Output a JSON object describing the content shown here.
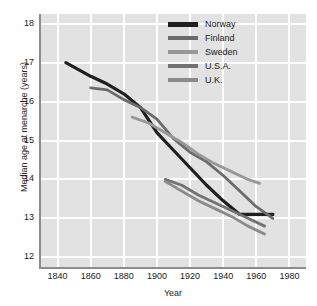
{
  "chart_data": {
    "type": "line",
    "title": "",
    "xlabel": "Year",
    "ylabel": "Median age at menarche (years)",
    "xlim": [
      1830,
      1990
    ],
    "ylim": [
      11.75,
      18.25
    ],
    "xticks": [
      1840,
      1860,
      1880,
      1900,
      1920,
      1940,
      1960,
      1980
    ],
    "yticks": [
      12,
      13,
      14,
      15,
      16,
      17,
      18
    ],
    "grid": true,
    "legend_position": "top-right",
    "background_color": "#e2e2e2",
    "gridline_color": "#ffffff",
    "axis_color": "#8c8c8c",
    "series": [
      {
        "name": "Norway",
        "color": "#1f1f1f",
        "x": [
          1845,
          1860,
          1870,
          1880,
          1890,
          1900,
          1910,
          1920,
          1930,
          1940,
          1950,
          1960,
          1970
        ],
        "values": [
          17.0,
          16.65,
          16.45,
          16.2,
          15.85,
          15.2,
          14.75,
          14.3,
          13.85,
          13.45,
          13.1,
          13.1,
          13.1
        ]
      },
      {
        "name": "Finland",
        "color": "#6b6b6b",
        "x": [
          1860,
          1870,
          1880,
          1890,
          1900,
          1910,
          1920,
          1930,
          1940,
          1950,
          1960,
          1970
        ],
        "values": [
          16.35,
          16.3,
          16.05,
          15.85,
          15.55,
          15.05,
          14.7,
          14.45,
          14.1,
          13.7,
          13.3,
          13.0
        ]
      },
      {
        "name": "Sweden",
        "color": "#989898",
        "x": [
          1885,
          1895,
          1905,
          1915,
          1925,
          1935,
          1945,
          1955,
          1962
        ],
        "values": [
          15.6,
          15.45,
          15.2,
          14.95,
          14.65,
          14.4,
          14.2,
          14.0,
          13.9
        ]
      },
      {
        "name": "U.S.A.",
        "color": "#727272",
        "x": [
          1905,
          1915,
          1925,
          1935,
          1945,
          1955,
          1965
        ],
        "values": [
          14.0,
          13.85,
          13.6,
          13.4,
          13.2,
          13.0,
          12.8
        ]
      },
      {
        "name": "U.K.",
        "color": "#8a8a8a",
        "x": [
          1905,
          1915,
          1925,
          1935,
          1945,
          1955,
          1965
        ],
        "values": [
          13.95,
          13.7,
          13.45,
          13.25,
          13.05,
          12.8,
          12.6
        ]
      }
    ]
  },
  "legend": {
    "items": [
      {
        "label": "Norway"
      },
      {
        "label": "Finland"
      },
      {
        "label": "Sweden"
      },
      {
        "label": "U.S.A."
      },
      {
        "label": "U.K."
      }
    ]
  },
  "axes": {
    "y_title": "Median age at menarche (years)",
    "x_title": "Year",
    "y_labels": [
      "18",
      "17",
      "16",
      "15",
      "14",
      "13",
      "12"
    ],
    "x_labels": [
      "1840",
      "1860",
      "1880",
      "1900",
      "1920",
      "1940",
      "1960",
      "1980"
    ]
  }
}
